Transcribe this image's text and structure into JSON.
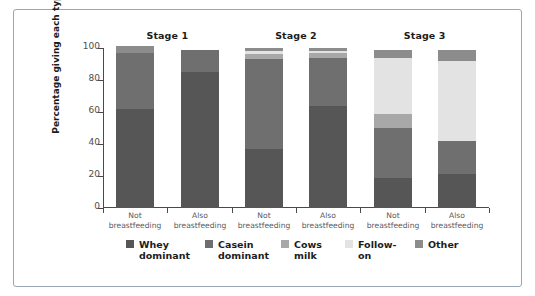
{
  "chart_data": {
    "type": "bar",
    "subtype": "stacked-bar-percentage",
    "title": "",
    "xlabel": "",
    "ylabel": "Percentage giving each type",
    "ylim": [
      0,
      100
    ],
    "yticks": [
      "0",
      "20",
      "40",
      "60",
      "80",
      "100"
    ],
    "grid": false,
    "legend_position": "bottom",
    "groups": [
      "Stage 1",
      "Stage 2",
      "Stage 3"
    ],
    "categories": [
      "Not breastfeeding",
      "Also breastfeeding",
      "Not breastfeeding",
      "Also breastfeeding",
      "Not breastfeeding",
      "Also breastfeeding"
    ],
    "series": [
      {
        "name": "Whey dominant",
        "color": "#565656",
        "values": [
          62,
          85,
          37,
          64,
          19,
          21
        ]
      },
      {
        "name": "Casein dominant",
        "color": "#6f6f6f",
        "values": [
          35,
          14,
          56,
          30,
          31,
          21
        ]
      },
      {
        "name": "Cows milk",
        "color": "#a8a8a8",
        "values": [
          0,
          0,
          3,
          3,
          9,
          0
        ]
      },
      {
        "name": "Follow-on",
        "color": "#e3e3e3",
        "values": [
          0,
          0,
          2,
          1,
          35,
          50
        ]
      },
      {
        "name": "Other",
        "color": "#8c8c8c",
        "values": [
          4,
          0,
          2,
          2,
          5,
          7
        ]
      }
    ]
  },
  "stage_titles": [
    {
      "label": "Stage 1"
    },
    {
      "label": "Stage 2"
    },
    {
      "label": "Stage 3"
    }
  ],
  "y_axis": {
    "title": "Percentage giving each type",
    "ticks": [
      {
        "value": "100"
      },
      {
        "value": "80"
      },
      {
        "value": "60"
      },
      {
        "value": "40"
      },
      {
        "value": "20"
      },
      {
        "value": "0"
      }
    ]
  },
  "x_labels": [
    {
      "line1": "Not",
      "line2": "breastfeeding"
    },
    {
      "line1": "Also",
      "line2": "breastfeeding"
    },
    {
      "line1": "Not",
      "line2": "breastfeeding"
    },
    {
      "line1": "Also",
      "line2": "breastfeeding"
    },
    {
      "line1": "Not",
      "line2": "breastfeeding"
    },
    {
      "line1": "Also",
      "line2": "breastfeeding"
    }
  ],
  "legend": {
    "items": [
      {
        "label": "Whey\ndominant",
        "color": "#565656"
      },
      {
        "label": "Casein\ndominant",
        "color": "#6f6f6f"
      },
      {
        "label": "Cows\nmilk",
        "color": "#a8a8a8"
      },
      {
        "label": "Follow-\non",
        "color": "#e3e3e3"
      },
      {
        "label": "Other",
        "color": "#8c8c8c"
      }
    ]
  },
  "colors": {
    "frame_border": "#9aa6b2",
    "axis": "#4a4a4a",
    "background": "#ffffff",
    "tick_text": "#4d4d4d",
    "label_text": "#5a5a5a",
    "title_text": "#1c1c1c"
  }
}
